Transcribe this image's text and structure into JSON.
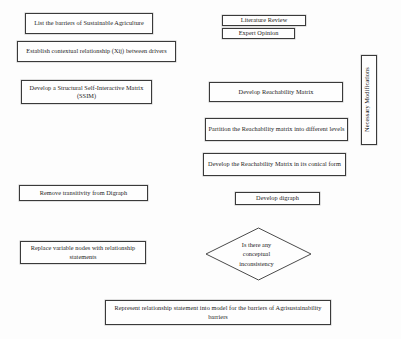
{
  "diagram": {
    "type": "flowchart",
    "canvas": {
      "width": 401,
      "height": 339
    },
    "line_color": "#4a4a4a",
    "text_color": "#1c1c1c",
    "background": "#fdfdfd"
  },
  "nodes": {
    "list_barriers": {
      "label": "List the barriers of Sustainable Agriculture",
      "shape": "rectangle",
      "x": 25,
      "y": 13,
      "w": 128,
      "h": 21
    },
    "contextual_relationship": {
      "label": "Establish contextual relationship (Xij) between drivers",
      "shape": "rectangle",
      "x": 17,
      "y": 41,
      "w": 159,
      "h": 21
    },
    "ssim": {
      "label": "Develop a Structural Self-Interactive Matrix (SSIM)",
      "shape": "rectangle",
      "x": 21,
      "y": 80,
      "w": 131,
      "h": 24
    },
    "remove_transitivity": {
      "label": "Remove transitivity from Digraph",
      "shape": "rectangle",
      "x": 19,
      "y": 185,
      "w": 129,
      "h": 16
    },
    "replace_nodes": {
      "label": "Replace variable nodes with relationship statements",
      "shape": "rectangle",
      "x": 20,
      "y": 241,
      "w": 126,
      "h": 23
    },
    "literature_review": {
      "label": "Literature Review",
      "shape": "rectangle",
      "x": 222,
      "y": 15,
      "w": 84,
      "h": 11
    },
    "expert_opinion": {
      "label": "Expert Opinion",
      "shape": "rectangle",
      "x": 222,
      "y": 28,
      "w": 73,
      "h": 11
    },
    "reachability_matrix": {
      "label": "Develop Reachability Matrix",
      "shape": "rectangle",
      "x": 209,
      "y": 82,
      "w": 134,
      "h": 20
    },
    "partition_matrix": {
      "label": "Partition the Reachability matrix into different levels",
      "shape": "rectangle",
      "x": 205,
      "y": 118,
      "w": 143,
      "h": 23
    },
    "conical_form": {
      "label": "Develop the Reachability Matrix in its conical form",
      "shape": "rectangle",
      "x": 203,
      "y": 153,
      "w": 143,
      "h": 23
    },
    "develop_digraph": {
      "label": "Develop digraph",
      "shape": "rectangle",
      "x": 235,
      "y": 192,
      "w": 85,
      "h": 13
    },
    "necessary_modifications": {
      "label": "Necessary Modifications",
      "shape": "rectangle-vertical",
      "x": 361,
      "y": 55,
      "w": 16,
      "h": 90
    },
    "decision": {
      "label_lines": [
        "Is there any",
        "conceptual",
        "inconsistency"
      ],
      "shape": "diamond",
      "x": 205,
      "y": 227,
      "w": 107,
      "h": 54
    },
    "represent_model": {
      "label": "Represent relationship statement into model for the barriers of Agrisustainability barriers",
      "shape": "rectangle",
      "x": 105,
      "y": 300,
      "w": 226,
      "h": 25
    }
  }
}
